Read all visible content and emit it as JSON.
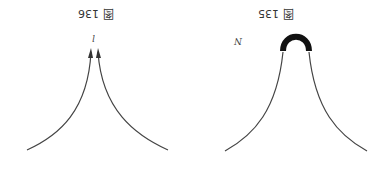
{
  "orientation": "rotated 180 degrees",
  "figures": [
    {
      "caption": "图 136",
      "label": "l",
      "description": "Two curves rising from lower left and lower right, converging toward a point with arrowheads"
    },
    {
      "caption": "图 135",
      "label": "N",
      "description": "Bell-shaped curve with a thick cap arc at its peak"
    }
  ]
}
